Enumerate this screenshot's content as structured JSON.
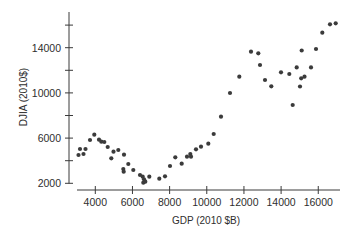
{
  "chart_data": {
    "type": "scatter",
    "title": "",
    "xlabel": "GDP (2010 $B)",
    "ylabel": "DJIA (2010$)",
    "xlim": [
      3000,
      17200
    ],
    "ylim": [
      2000,
      17000
    ],
    "x_ticks": [
      4000,
      6000,
      8000,
      10000,
      12000,
      14000,
      16000
    ],
    "x_tick_labels": [
      "4000",
      "6000",
      "8000",
      "10000",
      "12000",
      "14000",
      "16000"
    ],
    "y_ticks": [
      2000,
      6000,
      10000,
      14000
    ],
    "y_tick_labels": [
      "2000",
      "6000",
      "10000",
      "14000"
    ],
    "y_minor_ticks": [
      4000,
      8000,
      12000,
      16000
    ],
    "grid": false,
    "legend": null,
    "point_color": "#3b3b3b",
    "series": [
      {
        "name": "DJIA vs GDP",
        "x": [
          3096,
          3177,
          3365,
          3473,
          3715,
          3946,
          4199,
          4323,
          4484,
          4667,
          4861,
          4980,
          5238,
          5545,
          5776,
          5507,
          5529,
          6045,
          6406,
          6551,
          6621,
          6583,
          6691,
          6906,
          7444,
          7751,
          8020,
          8306,
          8650,
          8935,
          9113,
          9151,
          9420,
          9689,
          10082,
          10372,
          10765,
          11250,
          11750,
          12380,
          12773,
          12864,
          13133,
          13472,
          13995,
          14441,
          14624,
          14840,
          15017,
          15082,
          15259,
          15109,
          15610,
          15879,
          16218,
          16632,
          16939
        ],
        "y": [
          4504,
          5035,
          4593,
          5035,
          5832,
          6301,
          5858,
          5681,
          5655,
          5212,
          4212,
          4796,
          4947,
          4531,
          3708,
          3265,
          3027,
          3177,
          2735,
          2584,
          2354,
          2053,
          2142,
          2584,
          2407,
          2619,
          3531,
          4301,
          3735,
          4354,
          4593,
          4354,
          5009,
          5239,
          5504,
          6363,
          7894,
          9991,
          11434,
          13646,
          13504,
          12469,
          11142,
          10584,
          11823,
          11673,
          8929,
          12257,
          10566,
          11292,
          11434,
          13752,
          12257,
          13885,
          15327,
          16071,
          16159
        ]
      }
    ]
  }
}
